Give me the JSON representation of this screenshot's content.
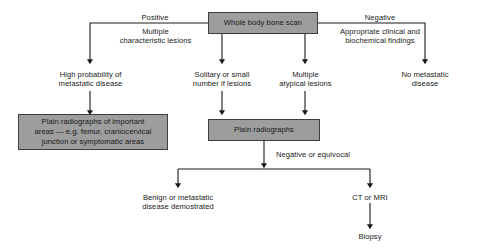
{
  "diagram": {
    "colors": {
      "box_fill": "#9d9d9d",
      "box_border": "#3d3d3d",
      "line": "#1a1a1a",
      "text": "#1a1a1a",
      "background": "#ffffff"
    },
    "nodes": {
      "root": "Whole body bone scan",
      "branch_positive_label": "Positive",
      "branch_positive_detail": "Multiple\ncharacteristic lesions",
      "branch_negative_label": "Negative",
      "branch_negative_detail": "Appropriate clinical and\nbiochemical findings",
      "outcome_high_probability": "High probability of\nmetastatic disease",
      "outcome_solitary": "Solitary or small\nnumber if lesions",
      "outcome_multiple_atypical": "Multiple\natypical lesions",
      "outcome_no_metastatic": "No metastatic\ndisease",
      "box_plain_radiographs_important": "Plain radiographs of important\nareas — e.g. femur, craniocervical\njunction or symptomatic areas",
      "box_plain_radiographs": "Plain radiographs",
      "label_negative_equivocal": "Negative or equivocal",
      "outcome_benign_or_metastatic": "Benign or metastatic\ndisease demostrated",
      "outcome_ct_or_mri": "CT or MRI",
      "outcome_biopsy": "Biopsy"
    }
  }
}
